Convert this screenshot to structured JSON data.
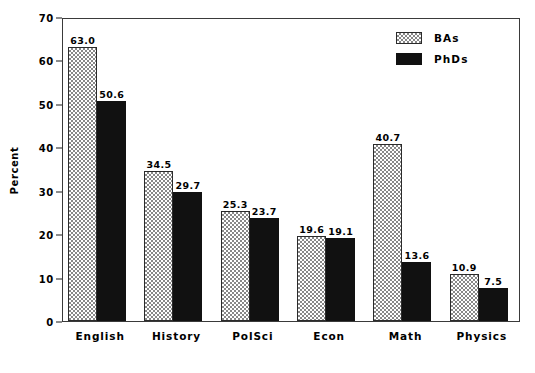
{
  "chart_data": {
    "type": "bar",
    "title": "",
    "xlabel": "",
    "ylabel": "Percent",
    "ylim": [
      0,
      70
    ],
    "yticks": [
      0,
      10,
      20,
      30,
      40,
      50,
      60,
      70
    ],
    "ytick_labels": [
      "0",
      "10",
      "20",
      "30",
      "40",
      "50",
      "60",
      "70"
    ],
    "grid": false,
    "legend_position": "top-right",
    "categories": [
      "English",
      "History",
      "PolSci",
      "Econ",
      "Math",
      "Physics"
    ],
    "series": [
      {
        "name": "BAs",
        "fill": "hatched",
        "color": "#ffffff",
        "values": [
          63.0,
          34.5,
          25.3,
          19.6,
          40.7,
          10.9
        ],
        "labels": [
          "63.0",
          "34.5",
          "25.3",
          "19.6",
          "40.7",
          "10.9"
        ]
      },
      {
        "name": "PhDs",
        "fill": "solid",
        "color": "#111111",
        "values": [
          50.6,
          29.7,
          23.7,
          19.1,
          13.6,
          7.5
        ],
        "labels": [
          "50.6",
          "29.7",
          "23.7",
          "19.1",
          "13.6",
          "7.5"
        ]
      }
    ]
  },
  "legend": {
    "items": [
      {
        "label": "BAs"
      },
      {
        "label": "PhDs"
      }
    ]
  }
}
